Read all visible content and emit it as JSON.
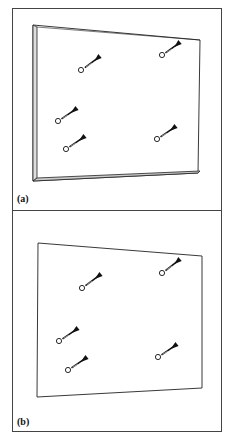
{
  "figure": {
    "panels": [
      {
        "id": "a",
        "label": "(a)",
        "description": "Board viewed in perspective with visible thickness; five darts with hole markers",
        "darts": [
          {
            "hole": [
              81,
              70
            ],
            "tip": [
              92,
              63
            ],
            "flight": [
              100,
              56
            ]
          },
          {
            "hole": [
              162,
              55
            ],
            "tip": [
              172,
              49
            ],
            "flight": [
              180,
              42
            ]
          },
          {
            "hole": [
              58,
              121
            ],
            "tip": [
              68,
              115
            ],
            "flight": [
              77,
              108
            ]
          },
          {
            "hole": [
              66,
              149
            ],
            "tip": [
              76,
              143
            ],
            "flight": [
              85,
              136
            ]
          },
          {
            "hole": [
              157,
              139
            ],
            "tip": [
              167,
              133
            ],
            "flight": [
              176,
              126
            ]
          }
        ]
      },
      {
        "id": "b",
        "label": "(b)",
        "description": "Flat quadrilateral board outline; five darts with hole markers",
        "darts": [
          {
            "hole": [
              82,
              288
            ],
            "tip": [
              92,
              281
            ],
            "flight": [
              101,
              274
            ]
          },
          {
            "hole": [
              162,
              273
            ],
            "tip": [
              172,
              266
            ],
            "flight": [
              180,
              259
            ]
          },
          {
            "hole": [
              59,
              341
            ],
            "tip": [
              69,
              335
            ],
            "flight": [
              78,
              328
            ]
          },
          {
            "hole": [
              68,
              370
            ],
            "tip": [
              78,
              364
            ],
            "flight": [
              87,
              357
            ]
          },
          {
            "hole": [
              158,
              357
            ],
            "tip": [
              168,
              351
            ],
            "flight": [
              177,
              344
            ]
          }
        ]
      }
    ]
  }
}
